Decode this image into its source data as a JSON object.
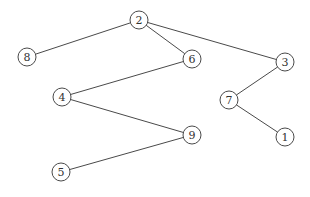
{
  "diagram": {
    "type": "tree-graph",
    "width": 310,
    "height": 197,
    "node_radius": 9,
    "colors": {
      "stroke": "#4a4a4a",
      "fill": "#ffffff",
      "label": "#333333",
      "background": "#ffffff"
    },
    "nodes": [
      {
        "id": "2",
        "label": "2",
        "x": 139,
        "y": 20
      },
      {
        "id": "8",
        "label": "8",
        "x": 27,
        "y": 57
      },
      {
        "id": "6",
        "label": "6",
        "x": 192,
        "y": 59
      },
      {
        "id": "3",
        "label": "3",
        "x": 285,
        "y": 62
      },
      {
        "id": "4",
        "label": "4",
        "x": 62,
        "y": 97
      },
      {
        "id": "7",
        "label": "7",
        "x": 229,
        "y": 100
      },
      {
        "id": "9",
        "label": "9",
        "x": 192,
        "y": 135
      },
      {
        "id": "1",
        "label": "1",
        "x": 285,
        "y": 137
      },
      {
        "id": "5",
        "label": "5",
        "x": 61,
        "y": 172
      }
    ],
    "edges": [
      {
        "from": "2",
        "to": "8"
      },
      {
        "from": "2",
        "to": "6"
      },
      {
        "from": "2",
        "to": "3"
      },
      {
        "from": "6",
        "to": "4"
      },
      {
        "from": "4",
        "to": "9"
      },
      {
        "from": "9",
        "to": "5"
      },
      {
        "from": "3",
        "to": "7"
      },
      {
        "from": "7",
        "to": "1"
      }
    ]
  }
}
